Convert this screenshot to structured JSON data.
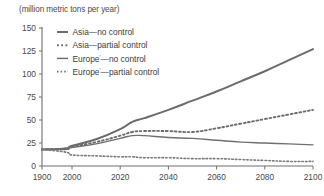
{
  "chart_data": {
    "type": "line",
    "title": "",
    "unit_label": "(million metric tons per year)",
    "xlabel": "",
    "ylabel": "",
    "xlim": [
      1900,
      2100
    ],
    "ylim": [
      0,
      150
    ],
    "x_ticks": [
      "1900",
      "2000",
      "2020",
      "2040",
      "2060",
      "2080",
      "2100"
    ],
    "x_tick_values": [
      1900,
      2000,
      2020,
      2040,
      2060,
      2080,
      2100
    ],
    "y_ticks": [
      "0",
      "25",
      "50",
      "75",
      "100",
      "125",
      "150"
    ],
    "y_tick_values": [
      0,
      25,
      50,
      75,
      100,
      125,
      150
    ],
    "grid": false,
    "legend_position": "top-left",
    "x_axis_compressed_note": "1900-2000 span rendered compressed relative to 2000-2100",
    "series": [
      {
        "name": "Asia—no control",
        "style": "solid",
        "width": 2.0,
        "color": "#6b6b6b",
        "x": [
          1900,
          1980,
          2000,
          2010,
          2020,
          2025,
          2030,
          2040,
          2050,
          2060,
          2070,
          2080,
          2090,
          2100
        ],
        "values": [
          18,
          19,
          22,
          29,
          40,
          48,
          52,
          61,
          71,
          81,
          92,
          103,
          115,
          127
        ]
      },
      {
        "name": "Asia—partial control",
        "style": "dotted",
        "width": 1.9,
        "color": "#6b6b6b",
        "x": [
          1900,
          1980,
          2000,
          2010,
          2020,
          2025,
          2030,
          2040,
          2050,
          2060,
          2070,
          2080,
          2090,
          2100
        ],
        "values": [
          18,
          19,
          21,
          26,
          33,
          37,
          38,
          38,
          37,
          41,
          46,
          51,
          56,
          61
        ]
      },
      {
        "name": "Europe—no control",
        "style": "solid",
        "width": 1.4,
        "color": "#6f6f6f",
        "x": [
          1900,
          1980,
          2000,
          2010,
          2020,
          2025,
          2030,
          2040,
          2050,
          2060,
          2070,
          2080,
          2090,
          2100
        ],
        "values": [
          18,
          18,
          20,
          24,
          30,
          33,
          33,
          31,
          30,
          28,
          26,
          25,
          24,
          23
        ]
      },
      {
        "name": "Europe—partial control",
        "style": "dotted",
        "width": 1.6,
        "color": "#7a7a7a",
        "x": [
          1900,
          1980,
          2000,
          2010,
          2020,
          2025,
          2030,
          2040,
          2050,
          2060,
          2070,
          2080,
          2090,
          2100
        ],
        "values": [
          18,
          15,
          12,
          11,
          10,
          10,
          9,
          9,
          8,
          8,
          7,
          6,
          5,
          5
        ]
      }
    ],
    "legend": [
      {
        "label": "Asia—no control",
        "sup": "",
        "style": "solid",
        "width": 2.0
      },
      {
        "label": "Asia—partial control",
        "sup": "",
        "style": "dotted",
        "width": 1.9
      },
      {
        "label": "Europe",
        "sup": "′",
        "label_tail": "—no control",
        "style": "solid",
        "width": 1.4
      },
      {
        "label": "Europe",
        "sup": "′",
        "label_tail": "—partial control",
        "style": "dotted",
        "width": 1.6
      }
    ],
    "colors": {
      "axis": "#6f6f6f",
      "text": "#4a4a4a",
      "line": "#6b6b6b",
      "background": "#ffffff"
    }
  }
}
